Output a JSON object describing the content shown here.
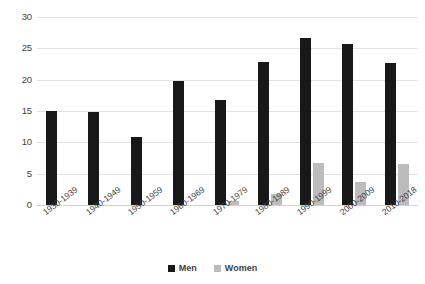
{
  "chart_data": {
    "type": "bar",
    "title": "",
    "subtitle": "",
    "xlabel": "",
    "ylabel": "",
    "ylim": [
      0,
      30
    ],
    "yticks": [
      0,
      5,
      10,
      15,
      20,
      25,
      30
    ],
    "ytick_labels": [
      "0",
      "5",
      "10",
      "15",
      "20",
      "25",
      "30"
    ],
    "grid": true,
    "legend_position": "bottom-center",
    "categories": [
      "1930-1939",
      "1940-1949",
      "1950-1959",
      "1960-1969",
      "1970-1979",
      "1980-1989",
      "1990-1999",
      "2000-2009",
      "2010-2018"
    ],
    "series": [
      {
        "name": "Men",
        "color": "#181818",
        "values": [
          15.0,
          14.9,
          10.9,
          19.8,
          16.8,
          22.8,
          26.7,
          25.7,
          22.6
        ]
      },
      {
        "name": "Women",
        "color": "#bcbcbc",
        "values": [
          0,
          0,
          0,
          0,
          0.7,
          1.8,
          6.7,
          3.7,
          6.5
        ]
      }
    ]
  },
  "legend": {
    "items": [
      {
        "label": "Men",
        "swatch": "men-swatch-icon"
      },
      {
        "label": "Women",
        "swatch": "women-swatch-icon"
      }
    ]
  },
  "colors": {
    "men": "#181818",
    "women": "#bcbcbc",
    "gridline": "#e3e3e3",
    "background": "#ffffff",
    "text": "#3f3f3f"
  }
}
